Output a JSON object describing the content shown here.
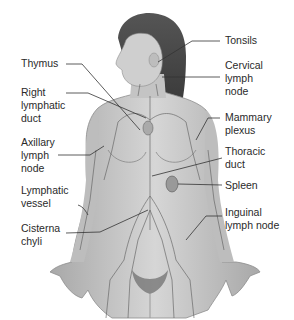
{
  "diagram": {
    "labels_left": [
      {
        "id": "thymus",
        "text": "Thymus"
      },
      {
        "id": "right-lymphatic-duct",
        "text": "Right\nlymphatic\nduct"
      },
      {
        "id": "axillary-lymph-node",
        "text": "Axillary\nlymph\nnode"
      },
      {
        "id": "lymphatic-vessel",
        "text": "Lymphatic\nvessel"
      },
      {
        "id": "cisterna-chyli",
        "text": "Cisterna\nchyli"
      }
    ],
    "labels_right": [
      {
        "id": "tonsils",
        "text": "Tonsils"
      },
      {
        "id": "cervical-lymph-node",
        "text": "Cervical\nlymph\nnode"
      },
      {
        "id": "mammary-plexus",
        "text": "Mammary\nplexus"
      },
      {
        "id": "thoracic-duct",
        "text": "Thoracic\nduct"
      },
      {
        "id": "spleen",
        "text": "Spleen"
      },
      {
        "id": "inguinal-lymph-node",
        "text": "Inguinal\nlymph node"
      }
    ],
    "colors": {
      "skin": "#c9c9c9",
      "skin_shadow": "#9a9a9a",
      "hair": "#4a4a4a",
      "vessel": "#5a5a5a",
      "leader_line": "#333333",
      "text": "#2a2a2a"
    }
  }
}
